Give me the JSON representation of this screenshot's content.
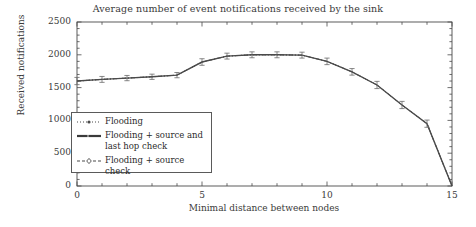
{
  "chart_data": {
    "type": "line",
    "title": "Average number of event notifications received by the sink",
    "xlabel": "Minimal distance between nodes",
    "ylabel": "Received notifications",
    "xlim": [
      0,
      15
    ],
    "ylim": [
      0,
      2500
    ],
    "xticks": [
      0,
      5,
      10,
      15
    ],
    "xtick_labels": [
      "0",
      "5",
      "10",
      "15"
    ],
    "yticks": [
      0,
      500,
      1000,
      1500,
      2000,
      2500
    ],
    "ytick_labels": [
      "0",
      "500",
      "1000",
      "1500",
      "2000",
      "2500"
    ],
    "x_minor_tick_step": 1,
    "y_minor_tick_step": 100,
    "grid": false,
    "legend_position": "lower-left-inside",
    "error_bars": true,
    "x": [
      0,
      1,
      2,
      3,
      4,
      5,
      6,
      7,
      8,
      9,
      10,
      11,
      12,
      13,
      14,
      15
    ],
    "series": [
      {
        "name": "Flooding",
        "style": "dotted",
        "marker": "dot",
        "color": "#4a4a4a",
        "values": [
          1600,
          1625,
          1645,
          1665,
          1690,
          1890,
          1980,
          2000,
          2000,
          1995,
          1900,
          1740,
          1540,
          1235,
          950,
          0
        ],
        "errors": [
          55,
          45,
          40,
          40,
          40,
          50,
          45,
          45,
          45,
          45,
          50,
          50,
          55,
          55,
          55,
          0
        ]
      },
      {
        "name": "Flooding + source and\nlast hop check",
        "style": "solid",
        "marker": "dot",
        "color": "#4a4a4a",
        "values": [
          1600,
          1625,
          1645,
          1665,
          1690,
          1890,
          1980,
          2000,
          2000,
          1995,
          1900,
          1740,
          1540,
          1235,
          950,
          0
        ],
        "errors": [
          55,
          45,
          40,
          40,
          40,
          50,
          45,
          45,
          45,
          45,
          50,
          50,
          55,
          55,
          55,
          0
        ]
      },
      {
        "name": "Flooding + source check",
        "style": "dashdot",
        "marker": "diamond",
        "color": "#4a4a4a",
        "values": [
          1600,
          1625,
          1645,
          1665,
          1690,
          1890,
          1980,
          2000,
          2000,
          1995,
          1900,
          1740,
          1540,
          1235,
          950,
          0
        ],
        "errors": [
          55,
          45,
          40,
          40,
          40,
          50,
          45,
          45,
          45,
          45,
          50,
          50,
          55,
          55,
          55,
          0
        ]
      }
    ],
    "legend": [
      {
        "label": "Flooding"
      },
      {
        "label": "Flooding + source and\nlast hop check"
      },
      {
        "label": "Flooding + source check"
      }
    ],
    "axis_color": "#4a4a4a",
    "line_color": "#4a4a4a"
  }
}
